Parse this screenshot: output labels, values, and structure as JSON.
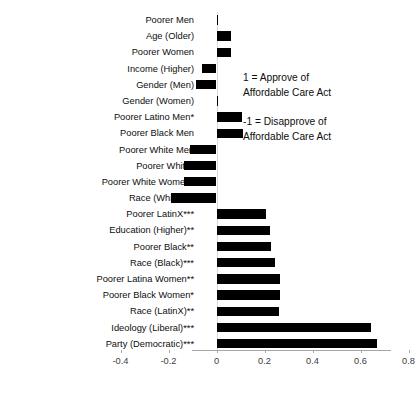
{
  "chart_data": {
    "type": "bar",
    "orientation": "horizontal",
    "title": "",
    "xlabel": "",
    "ylabel": "",
    "xlim": [
      -0.4,
      0.8
    ],
    "xticks": [
      -0.4,
      -0.2,
      0,
      0.2,
      0.4,
      0.6,
      0.8
    ],
    "xtick_labels": [
      "-0.4",
      "-0.2",
      "0",
      "0.2",
      "0.4",
      "0.6",
      "0.8"
    ],
    "grid": false,
    "legend": "none",
    "bar_color": "#000000",
    "zero_line_color": "#d9d9d9",
    "axis_color": "#a6a6a6",
    "categories": [
      "Poorer Men",
      "Age (Older)",
      "Poorer Women",
      "Income (Higher)",
      "Gender (Men)",
      "Gender (Women)",
      "Poorer Latino Men*",
      "Poorer Black Men",
      "Poorer White Men",
      "Poorer White*",
      "Poorer White Women*",
      "Race (White)***",
      "Poorer LatinX***",
      "Education (Higher)**",
      "Poorer Black**",
      "Race (Black)***",
      "Poorer Latina Women**",
      "Poorer Black Women*",
      "Race (LatinX)**",
      "Ideology (Liberal)***",
      "Party (Democratic)***"
    ],
    "values": [
      0.005,
      0.062,
      0.062,
      -0.062,
      -0.087,
      0.0,
      0.108,
      0.112,
      -0.112,
      -0.137,
      -0.137,
      -0.191,
      0.208,
      0.222,
      0.229,
      0.245,
      0.266,
      0.266,
      0.262,
      0.645,
      0.668
    ],
    "annotations": [
      {
        "name": "approve-note",
        "line1": "1 = Approve of",
        "line2": "Affordable Care Act"
      },
      {
        "name": "disapprove-note",
        "line1": "-1 = Disapprove of",
        "line2": "Affordable Care Act"
      }
    ]
  }
}
